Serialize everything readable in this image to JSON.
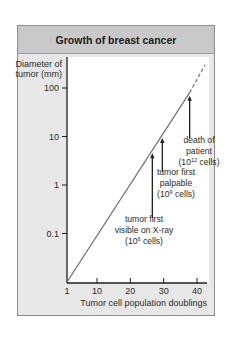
{
  "chart_data": {
    "type": "line",
    "title": "Growth of breast cancer",
    "xlabel": "Tumor cell population doublings",
    "ylabel": "Diameter of tumor (mm)",
    "ylabel_lines": [
      "Diameter of",
      "tumor (mm)"
    ],
    "yscale": "log",
    "ylim": [
      0.01,
      300
    ],
    "xlim": [
      1,
      43
    ],
    "xticks": [
      1,
      10,
      20,
      30,
      40
    ],
    "xtick_labels": [
      "1",
      "10",
      "20",
      "30",
      "40"
    ],
    "yticks": [
      100,
      10,
      1,
      0.1
    ],
    "ytick_labels": [
      "100",
      "10",
      "1",
      "0.1"
    ],
    "series": [
      {
        "name": "tumor growth",
        "style": "solid",
        "x": [
          1,
          37.8
        ],
        "y": [
          0.01,
          80
        ]
      },
      {
        "name": "tumor growth (extrapolated)",
        "style": "dashed",
        "x": [
          37.8,
          42.4
        ],
        "y": [
          80,
          300
        ]
      }
    ],
    "annotations": [
      {
        "id": "xray",
        "lines": [
          "tumor first",
          "visible on X-ray"
        ],
        "cells_base": "(10",
        "cells_exp": "6",
        "cells_tail": " cells)",
        "x": 26.6
      },
      {
        "id": "palpable",
        "lines": [
          "tumor first",
          "palpable"
        ],
        "cells_base": "(10",
        "cells_exp": "9",
        "cells_tail": " cells)",
        "x": 29.6
      },
      {
        "id": "death",
        "lines": [
          "death of",
          "patient"
        ],
        "cells_base": "(10",
        "cells_exp": "12",
        "cells_tail": " cells)",
        "x": 37.8
      }
    ],
    "grid": false,
    "colors": {
      "line": "#6e6e6e",
      "axis": "#1e1e1e",
      "arrow": "#1e1e1e"
    }
  }
}
